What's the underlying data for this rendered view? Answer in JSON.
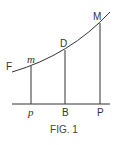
{
  "figure": {
    "caption": "FIG. 1",
    "curve_label": "F",
    "points_on_curve": [
      {
        "label": "m",
        "italic": true
      },
      {
        "label": "D",
        "italic": false
      },
      {
        "label": "M",
        "italic": false
      }
    ],
    "points_on_axis": [
      {
        "label": "p",
        "italic": true
      },
      {
        "label": "B",
        "italic": false
      },
      {
        "label": "P",
        "italic": false
      }
    ],
    "stroke_color": "#333333"
  }
}
